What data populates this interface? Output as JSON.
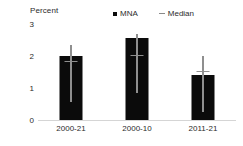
{
  "chart_data": {
    "type": "bar",
    "title": "",
    "subtitle": "",
    "xlabel": "",
    "ylabel": "Percent",
    "ylim": [
      0,
      3
    ],
    "yticks": [
      0,
      1,
      2,
      3
    ],
    "ytick_labels": [
      "0",
      "1",
      "2",
      "3"
    ],
    "grid": false,
    "legend_position": "top",
    "categories": [
      "2000-21",
      "2000-10",
      "2011-21"
    ],
    "series": [
      {
        "name": "MNA",
        "type": "bar",
        "color": "#0b0b0b",
        "values": [
          2.0,
          2.55,
          1.42
        ]
      },
      {
        "name": "Median",
        "type": "errorbar-with-median-marker",
        "color": "#8f8f8f",
        "median_values": [
          1.8,
          2.0,
          1.5
        ],
        "error_low": [
          0.55,
          0.85,
          0.25
        ],
        "error_high": [
          2.35,
          2.7,
          2.0
        ]
      }
    ],
    "legend": [
      {
        "label": "MNA",
        "marker": "square",
        "color": "#0b0b0b"
      },
      {
        "label": "Median",
        "marker": "dash",
        "color": "#8f8f8f"
      }
    ]
  },
  "axis": {
    "y_title": "Percent"
  }
}
